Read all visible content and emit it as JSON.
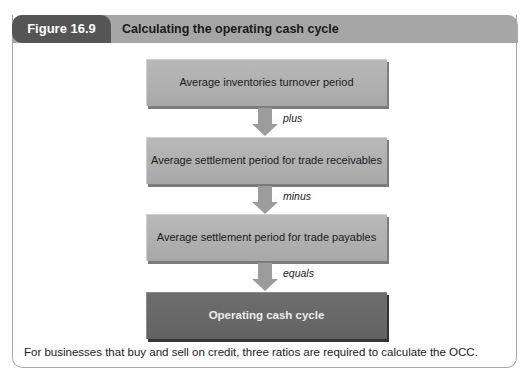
{
  "figure": {
    "number": "Figure 16.9",
    "title": "Calculating the operating cash cycle",
    "colors": {
      "tab": "#555555",
      "band": "#a6a6a6",
      "box": "#b0b0b0",
      "final_box": "#666666",
      "arrow": "#9c9c9c"
    }
  },
  "diagram": {
    "steps": [
      {
        "label": "Average inventories turnover period"
      },
      {
        "label": "Average settlement period for trade receivables"
      },
      {
        "label": "Average settlement period for trade payables"
      },
      {
        "label": "Operating cash cycle"
      }
    ],
    "operators": [
      "plus",
      "minus",
      "equals"
    ]
  },
  "caption": "For businesses that buy and sell on credit, three ratios are required to calculate the OCC."
}
